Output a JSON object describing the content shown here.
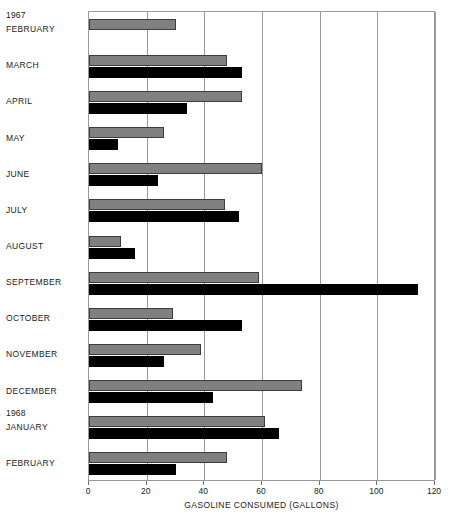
{
  "chart_data": {
    "type": "bar",
    "orientation": "horizontal",
    "title": "",
    "xlabel": "GASOLINE CONSUMED (GALLONS)",
    "ylabel": "",
    "xlim": [
      0,
      120
    ],
    "xticks": [
      0,
      20,
      40,
      60,
      80,
      100,
      120
    ],
    "xtick_labels": [
      "0",
      "20",
      "40",
      "60",
      "80",
      "100",
      "120"
    ],
    "grid": "vertical",
    "legend": "none",
    "categories": [
      "FEBRUARY",
      "MARCH",
      "APRIL",
      "MAY",
      "JUNE",
      "JULY",
      "AUGUST",
      "SEPTEMBER",
      "OCTOBER",
      "NOVEMBER",
      "DECEMBER",
      "JANUARY",
      "FEBRUARY"
    ],
    "group_year_markers": [
      {
        "label": "1967",
        "before_category_index": 0
      },
      {
        "label": "1968",
        "before_category_index": 11
      }
    ],
    "series": [
      {
        "name": "gray",
        "color": "#808080",
        "values": [
          30,
          48,
          53,
          26,
          60,
          47,
          11,
          59,
          29,
          39,
          74,
          61,
          48
        ]
      },
      {
        "name": "black",
        "color": "#000000",
        "values": [
          0,
          53,
          34,
          10,
          24,
          52,
          16,
          114,
          53,
          26,
          43,
          66,
          30
        ]
      }
    ]
  },
  "axis": {
    "title": "GASOLINE CONSUMED (GALLONS)",
    "tick_labels": [
      "0",
      "20",
      "40",
      "60",
      "80",
      "100",
      "120"
    ]
  },
  "rows": [
    {
      "label": "FEBRUARY",
      "year": "1967"
    },
    {
      "label": "MARCH",
      "year": ""
    },
    {
      "label": "APRIL",
      "year": ""
    },
    {
      "label": "MAY",
      "year": ""
    },
    {
      "label": "JUNE",
      "year": ""
    },
    {
      "label": "JULY",
      "year": ""
    },
    {
      "label": "AUGUST",
      "year": ""
    },
    {
      "label": "SEPTEMBER",
      "year": ""
    },
    {
      "label": "OCTOBER",
      "year": ""
    },
    {
      "label": "NOVEMBER",
      "year": ""
    },
    {
      "label": "DECEMBER",
      "year": ""
    },
    {
      "label": "JANUARY",
      "year": "1968"
    },
    {
      "label": "FEBRUARY",
      "year": ""
    }
  ]
}
